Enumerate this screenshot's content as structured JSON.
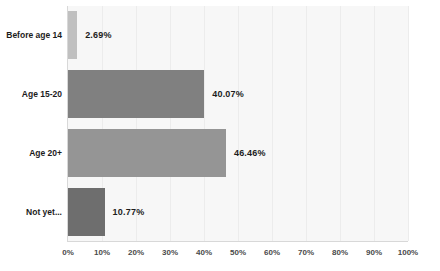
{
  "chart_data": {
    "type": "bar",
    "orientation": "horizontal",
    "title": "",
    "subtitle": "",
    "xlabel": "",
    "ylabel": "",
    "xlim": [
      0,
      100
    ],
    "grid": true,
    "legend": false,
    "categories": [
      "Before age 14",
      "Age 15-20",
      "Age 20+",
      "Not yet..."
    ],
    "values": [
      2.69,
      40.07,
      46.46,
      10.77
    ],
    "data_labels": [
      "2.69%",
      "40.07%",
      "46.46%",
      "10.77%"
    ],
    "bar_colors": [
      "#c0c0c0",
      "#808080",
      "#959595",
      "#6e6e6e"
    ],
    "xticks": [
      0,
      10,
      20,
      30,
      40,
      50,
      60,
      70,
      80,
      90,
      100
    ],
    "xtick_labels": [
      "0%",
      "10%",
      "20%",
      "30%",
      "40%",
      "50%",
      "60%",
      "70%",
      "80%",
      "90%",
      "100%"
    ],
    "plot_background": "#f7f7f7",
    "gridline_color": "#ececec",
    "axis_color": "#d8d8d8",
    "label_color": "#1c1c1c"
  }
}
